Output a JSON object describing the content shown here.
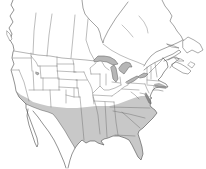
{
  "map": {
    "kind": "species-range-map",
    "viewbox": "0 0 206 169",
    "colors": {
      "background": "#ffffff",
      "land": "#ffffff",
      "outline": "#575757",
      "border": "#6b6b6b",
      "range": "#c8c8c8",
      "patch": "#b2b2b2",
      "lake": "#b6b6b6",
      "bay": "#8e8e8e"
    },
    "layers": [
      {
        "name": "range-shaded-region",
        "fill": "range",
        "stroke": "none",
        "w": 0,
        "d": "M16,91 L19,97 L23,101 L26,104 L33,107 L41,110 L48,112 L53,114 L57,119 L61,125 L65,131 L69,138 L72,143 L75,148 L78,144 L82,140 L86,143 L90,141 L95,141 L98,143 L104,145 L101,141 L104,139 L108,138 L113,136 L119,136 L125,138 L129,140 L132,145 L135,151 L138,157 L141,160 L143,154 L142,147 L140,140 L138,134 L139,131 L143,128 L148,123 L153,118 L157,113 L155,110 L151,107 L150,105 L151,103 L150,99 L148,96 L141,96 L134,98 L126,101 L118,104 L110,106 L103,106 L96,106 L87,107 L77,108 L67,108 L57,107 L48,106 L40,104 L33,102 L27,98 L21,95 Z"
      },
      {
        "name": "new-england-coastal-range-patch",
        "fill": "patch",
        "stroke": "none",
        "w": 0,
        "d": "M154,84 L159,83 L164,85 L167,87 L166,89 L160,88 L155,87 Z"
      },
      {
        "name": "canada-province-borders",
        "fill": "none",
        "stroke": "border",
        "w": 0.45,
        "d": "M36,13 L34,31 L33,54 M52,14 L49,35 L47,56 M75,15 L73,37 L71,58 M88,19 L86,40 L90,52 L95,61"
      },
      {
        "name": "ontario-quebec-border",
        "fill": "none",
        "stroke": "border",
        "w": 0.45,
        "d": "M103,44 L111,50 L120,55 L129,59 L137,62 L144,65"
      },
      {
        "name": "quebec-rivers",
        "fill": "none",
        "stroke": "border",
        "w": 0.4,
        "d": "M139,16 L144,22 L147,28 L148,33 M122,25 L128,31 L133,37"
      },
      {
        "name": "us-canada-border",
        "fill": "none",
        "stroke": "border",
        "w": 0.5,
        "d": "M14,51 L26,53 L38,55 L50,56 L62,58 L74,59 L86,60 L95,61 M149,73 L153,69 L157,65 L161,61 L163,58"
      },
      {
        "name": "us-state-borders",
        "fill": "none",
        "stroke": "border",
        "w": 0.45,
        "d": "M13,58 L31,58 M31,53 L32,71 M12,70 L19,70 M19,70 L24,82 L29,101 M33,71 L34,90 M31,56 L36,62 L38,66 M38,66 L57,66 M40,66 L41,78 M57,57 L57,66 M57,64 L74,64 M57,66 L58,78 M41,78 L58,78 M43,78 L43,90 M29,90 L60,90 M59,78 L59,90 M57,71 L76,72 M58,79 L77,80 M59,87 L78,88 M50,90 L51,107 M66,90 L66,103 M66,95 L74,97 L80,97 M74,88 L74,97 M78,88 L79,97 M77,80 L77,88 M74,72 L84,72 M76,80 L87,80 M73,60 L74,66 L74,72 M96,63 L90,68 L91,74 M91,74 L100,74 M84,72 L87,79 L90,84 L92,89 L93,96 M93,96 L96,106 L98,115 L99,125 L100,134 M100,74 L100,86 M106,74 L106,85 M121,85 L115,88 L109,90 L104,90 L100,86 L96,90 L93,93 M93,95 L112,96 M112,96 L119,91 M119,91 L124,87 L128,85 M94,101 L114,102 M105,102 L107,137 M114,102 L116,122 L118,135 M115,135 L135,136 M122,112 L131,120 L140,128 M113,111 L129,114 L145,118 M110,107 L150,108 M120,77 L121,85 M122,89 L139,90 M131,92 L135,95 L139,99 M131,83 L145,84 M145,84 L147,89 L149,93 M140,93 L145,94 M147,67 L147,84 M151,66 L151,79 M155,63 L157,77 M147,80 L159,81 M147,85 L158,86 M154,86 L154,89 M112,82 L120,83 M102,62 L105,67 L109,70 M80,97 L82,118 L84,140 M93,97 L94,104"
      },
      {
        "name": "us-mexico-border",
        "fill": "none",
        "stroke": "outline",
        "w": 0.5,
        "d": "M26,104 L33,107 L41,110 L48,112 L53,114 L57,119 L61,125 L65,131 L69,138 L72,143 L75,148"
      },
      {
        "name": "hudson-bay-coastline",
        "fill": "none",
        "stroke": "outline",
        "w": 0.55,
        "d": "M82,0 L83,8 L85,14 L89,19 L94,24 L98,28 L100,33 L101,38 L103,43 L104,39 L106,35 L108,31 L111,26 L116,18 L122,10 L128,2"
      },
      {
        "name": "labrador-quebec-coastline",
        "fill": "none",
        "stroke": "outline",
        "w": 0.55,
        "d": "M162,0 L165,6 L169,11 L172,16 L170,21 L174,26 L177,31 L181,36 L183,40 M183,40 L177,43 L170,46 L163,49 L156,52 L151,56 L147,61 L144,66"
      },
      {
        "name": "st-lawrence-gaspe-coastline",
        "fill": "none",
        "stroke": "outline",
        "w": 0.55,
        "d": "M144,70 L149,66 L154,63 L160,60 L166,57 L173,54 L179,50 L181,52 L175,56 L169,59 L164,61"
      },
      {
        "name": "new-brunswick-coastline",
        "fill": "none",
        "stroke": "outline",
        "w": 0.5,
        "d": "M168,60 L172,58 L176,57 L179,59 M179,59 L175,62 L172,65 L170,68"
      },
      {
        "name": "west-coastline",
        "fill": "none",
        "stroke": "outline",
        "w": 0.65,
        "d": "M13,0 L11,5 L14,10 L10,16 L13,22 L9,28 L12,34 L10,40 L13,45 L14,50 L13,52 L12,58 L14,64 L11,70 L13,77 L15,85 L16,91 L19,97 L23,101 L26,104 L26,108 L28,114 L31,122 L34,130 L37,138 L38,144 L37,147 L35,143 L32,134 L29,125 L27,116 L28,109 M33,111 L38,117 L43,124 L49,132 L54,140 L58,148 L61,155 L64,162 L66,168"
      },
      {
        "name": "east-gulf-coastline",
        "fill": "none",
        "stroke": "outline",
        "w": 0.65,
        "d": "M163,58 L167,62 L168,67 L164,72 L161,77 L158,80 L162,82 L166,84 L168,87 L164,87 L159,87 L155,88 L153,90 L151,94 L150,97 L152,98 L150,99 L151,103 L150,105 L151,107 L155,110 L157,113 L153,118 L148,123 L143,128 L139,131 L138,134 L140,140 L142,147 L143,154 L141,160 L138,157 L135,151 L132,145 L129,140 L125,138 L119,136 L113,136 L108,138 L104,139 L101,141 L104,145 L98,143 L95,141 L90,141 L86,143 L82,140 L78,144 L75,148 L72,154 L70,160 L68,168"
      },
      {
        "name": "vancouver-island",
        "fill": "land",
        "stroke": "outline",
        "w": 0.45,
        "d": "M7,31 L10,34 L12,39 L10,41 L7,35 Z"
      },
      {
        "name": "long-island",
        "fill": "none",
        "stroke": "outline",
        "w": 0.45,
        "d": "M153,90 L158,90 L163,91"
      },
      {
        "name": "nova-scotia",
        "fill": "none",
        "stroke": "outline",
        "w": 0.5,
        "d": "M173,67 L178,70 L183,73 L188,74 L191,71 L186,67 L181,64 L176,62 L172,64 Z"
      },
      {
        "name": "cape-breton-island",
        "fill": "none",
        "stroke": "outline",
        "w": 0.45,
        "d": "M188,65 L192,68 L195,64 L191,62 Z"
      },
      {
        "name": "prince-edward-island",
        "fill": "none",
        "stroke": "outline",
        "w": 0.45,
        "d": "M175,58 L181,59 L184,61 L178,61 Z"
      },
      {
        "name": "newfoundland",
        "fill": "none",
        "stroke": "outline",
        "w": 0.5,
        "d": "M183,41 L188,37 L194,40 L200,44 L203,50 L198,53 L192,50 L187,53 L183,48 Z"
      },
      {
        "name": "anticosti-island",
        "fill": "none",
        "stroke": "outline",
        "w": 0.45,
        "d": "M167,44 L174,46 L179,48 L172,47 Z"
      },
      {
        "name": "lake-superior",
        "fill": "lake",
        "stroke": "outline",
        "w": 0.5,
        "d": "M94,60 L98,56 L104,56 L110,57 L115,60 L118,64 L113,65 L107,62 L100,61 L95,62 Z"
      },
      {
        "name": "lake-michigan",
        "fill": "lake",
        "stroke": "outline",
        "w": 0.5,
        "d": "M111,67 L114,65 L116,68 L117,73 L118,79 L116,82 L113,79 L112,73 Z"
      },
      {
        "name": "lake-huron",
        "fill": "lake",
        "stroke": "outline",
        "w": 0.5,
        "d": "M119,68 L122,64 L126,62 L130,63 L132,67 L129,67 L127,70 L124,74 L120,71 Z"
      },
      {
        "name": "lake-erie",
        "fill": "lake",
        "stroke": "outline",
        "w": 0.5,
        "d": "M126,82 L131,79 L137,76 L139,77 L134,81 L128,84 Z"
      },
      {
        "name": "lake-ontario",
        "fill": "lake",
        "stroke": "outline",
        "w": 0.5,
        "d": "M139,76 L144,73 L148,74 L145,77 L140,78 Z"
      },
      {
        "name": "great-salt-lake",
        "fill": "lake",
        "stroke": "outline",
        "w": 0.4,
        "d": "M36,72 L39,73 L38,75 L36,74 Z"
      },
      {
        "name": "chesapeake-bay",
        "fill": "bay",
        "stroke": "outline",
        "w": 0.4,
        "d": "M146,93 L148,96 L150,100 L151,104 L149,103 L147,99 L145,95 Z"
      }
    ]
  }
}
